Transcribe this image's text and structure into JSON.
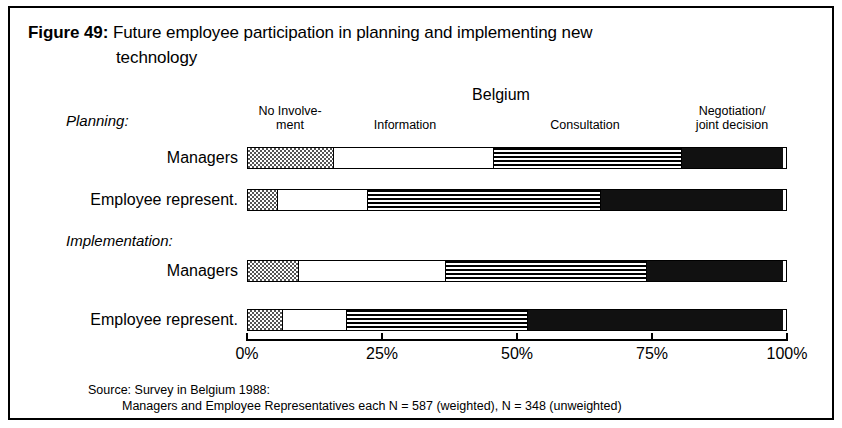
{
  "figure": {
    "number": "Figure 49:",
    "title_line1": "Future employee participation in planning and implementing new",
    "title_line2": "technology"
  },
  "country": "Belgium",
  "legend": {
    "no_involvement": "No Involve-\nment",
    "no_involvement_l1": "No Involve-",
    "no_involvement_l2": "ment",
    "information": "Information",
    "consultation": "Consultation",
    "negotiation_l1": "Negotiation/",
    "negotiation_l2": "joint decision"
  },
  "groups": {
    "planning": "Planning:",
    "implementation": "Implementation:"
  },
  "rows": {
    "managers": "Managers",
    "employee_represent": "Employee represent."
  },
  "axis": {
    "ticks": [
      "0%",
      "25%",
      "50%",
      "75%",
      "100%"
    ],
    "tick_values": [
      0,
      25,
      50,
      75,
      100
    ]
  },
  "source": {
    "line1": "Source: Survey in Belgium 1988:",
    "line2": "Managers and Employee Representatives each N = 587 (weighted), N = 348 (unweighted)"
  },
  "colors": {
    "frame": "#000000",
    "no_involvement": "#808080",
    "information": "#ffffff",
    "consultation": "#000000",
    "negotiation": "#111111",
    "text": "#000000",
    "background": "#ffffff"
  },
  "chart_data": {
    "type": "bar",
    "orientation": "horizontal",
    "stacked": true,
    "normalized_percent": true,
    "title": "Future employee participation in planning and implementing new technology",
    "subtitle": "Belgium",
    "xlabel": "",
    "ylabel": "",
    "xlim": [
      0,
      100
    ],
    "grid": false,
    "legend_position": "top",
    "categories": [
      "Planning: Managers",
      "Planning: Employee represent.",
      "Implementation: Managers",
      "Implementation: Employee represent."
    ],
    "series": [
      {
        "name": "No Involvement",
        "pattern": "checker",
        "values": [
          16,
          5.5,
          9.5,
          6.5
        ]
      },
      {
        "name": "Information",
        "pattern": "white",
        "values": [
          30,
          17,
          27.5,
          12
        ]
      },
      {
        "name": "Consultation",
        "pattern": "hstripe",
        "values": [
          35,
          43.5,
          37.5,
          34
        ]
      },
      {
        "name": "Negotiation/joint decision",
        "pattern": "solid",
        "values": [
          19,
          34,
          25.5,
          47.5
        ]
      }
    ],
    "annotations": [
      "Source: Survey in Belgium 1988:",
      "Managers and Employee Representatives each N = 587 (weighted), N = 348 (unweighted)"
    ]
  }
}
